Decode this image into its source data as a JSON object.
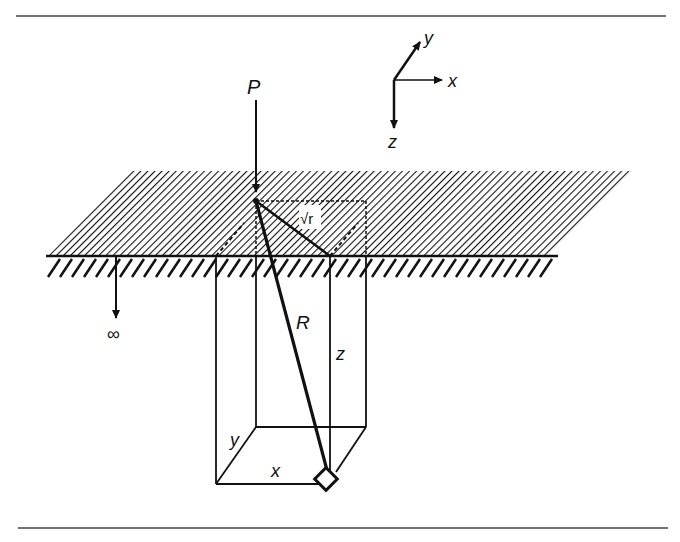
{
  "diagram": {
    "colors": {
      "ink": "#111111",
      "background": "#ffffff"
    },
    "labels": {
      "load": "P",
      "distance": "R",
      "depth": "z",
      "box_x": "x",
      "box_y": "y",
      "surface_radius": "√r",
      "infinity": "∞"
    },
    "axes": {
      "x": "x",
      "y": "y",
      "z": "z"
    }
  }
}
